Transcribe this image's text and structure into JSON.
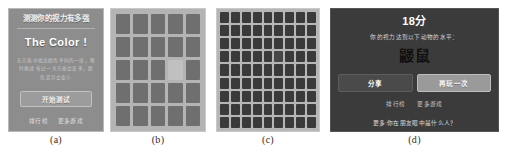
{
  "figure": {
    "panels": [
      {
        "caption": "(a)",
        "name": "start-screen",
        "title": "测测你的视力有多强",
        "brand": "The Color !",
        "description": "在方格中找出颜色不同的一块，限时挑战\n每过一关方格会变多，颜色差异会变小",
        "start_button": "开始测试",
        "links": [
          "排行榜",
          "更多游戏"
        ]
      },
      {
        "caption": "(b)",
        "name": "grid-level-easy",
        "rows": 5,
        "cols": 5,
        "odd_tile": {
          "row": 3,
          "col": 4
        },
        "tile_color": "#6f6f6f",
        "odd_tile_color": "#c0c0c0",
        "background": "#b4b4b4"
      },
      {
        "caption": "(c)",
        "name": "grid-level-hard",
        "rows": 9,
        "cols": 9,
        "odd_tile": {
          "row": 4,
          "col": 6
        },
        "tile_color": "#3a3a3a",
        "odd_tile_color": "#474747",
        "background": "#b6b6b6"
      },
      {
        "caption": "(d)",
        "name": "result-screen",
        "score": "18分",
        "subtitle": "你的视力达到以下动物的水平：",
        "animal": "鼹鼠",
        "share_button": "分享",
        "replay_button": "再玩一次",
        "links": [
          "排行榜",
          "更多游戏"
        ],
        "footer": "更多:你在朋友眼中是什么人？"
      }
    ]
  }
}
